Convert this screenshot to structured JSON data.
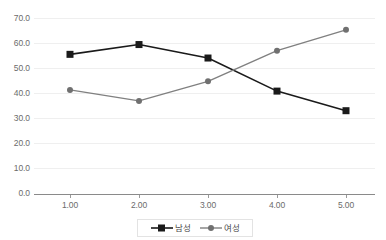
{
  "chart_data": {
    "type": "line",
    "title": "",
    "subtitle": "",
    "xlabel": "",
    "ylabel": "",
    "categories": [
      "1.00",
      "2.00",
      "3.00",
      "4.00",
      "5.00"
    ],
    "x": [
      1,
      2,
      3,
      4,
      5
    ],
    "ylim": [
      0.0,
      70.0
    ],
    "ytick_labels": [
      "70.0",
      "60.0",
      "50.0",
      "40.0",
      "30.0",
      "20.0",
      "10.0",
      "0.0"
    ],
    "ytick_values": [
      70.0,
      60.0,
      50.0,
      40.0,
      30.0,
      20.0,
      10.0,
      0.0
    ],
    "grid": true,
    "grid_axis": "y",
    "legend_position": "bottom",
    "series": [
      {
        "name": "남성",
        "values": [
          57.0,
          61.0,
          55.5,
          42.0,
          34.0
        ],
        "color": "#1a1a1a",
        "marker": "square"
      },
      {
        "name": "여성",
        "values": [
          42.5,
          38.0,
          46.0,
          58.5,
          67.0
        ],
        "color": "#808080",
        "marker": "circle"
      }
    ]
  },
  "legend": {
    "entries": [
      {
        "label": "남성",
        "marker": "square-marker",
        "color": "#1a1a1a"
      },
      {
        "label": "여성",
        "marker": "circle-marker",
        "color": "#808080"
      }
    ]
  },
  "axes": {
    "y_color": "#6b6b6b",
    "x_color": "#6b6b6b",
    "axis_line_color": "#8a8a8a",
    "gridline_color": "#efefef"
  }
}
